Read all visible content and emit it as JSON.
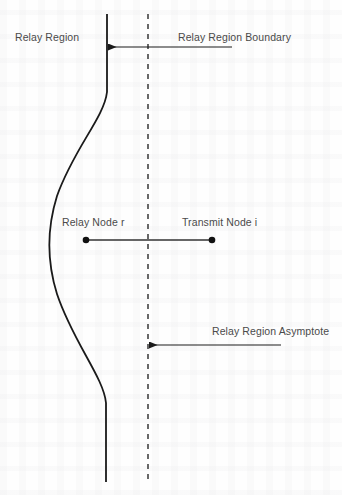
{
  "figure": {
    "width": 342,
    "height": 495,
    "background_color": "#fefefe",
    "ink_color": "#1a1a1a",
    "label_color": "#4a4a4a"
  },
  "labels": {
    "relay_region": "Relay Region",
    "relay_region_boundary": "Relay Region Boundary",
    "relay_node": "Relay Node r",
    "transmit_node": "Transmit Node i",
    "relay_region_asymptote": "Relay Region Asymptote"
  },
  "geometry": {
    "boundary_curve": {
      "name": "relay-region-boundary-curve",
      "style": "solid",
      "stroke_width": 1.8,
      "path": "M 107 14 L 107 92 C 104 118 74 148 57 196 C 47 228 47 262 57 294 C 73 342 104 378 106 403 L 106 482",
      "description": "Solid curve: vertical at top, bulging leftward through the middle, vertical at bottom"
    },
    "asymptote_line": {
      "name": "relay-region-asymptote-line",
      "style": "dashed",
      "x": 148,
      "y_start": 14,
      "y_end": 482,
      "dash": "5 5",
      "stroke_width": 1.4
    },
    "node_link": {
      "name": "node-connecting-line",
      "x_start": 86,
      "x_end": 212,
      "y": 240,
      "stroke_width": 1.3
    },
    "relay_node_point": {
      "x": 86,
      "y": 240,
      "radius": 3.3
    },
    "transmit_node_point": {
      "x": 212,
      "y": 240,
      "radius": 3.3
    },
    "boundary_arrow": {
      "name": "boundary-annotation-arrow",
      "x_tail": 232,
      "x_head": 108,
      "y": 47,
      "stroke_width": 1.2
    },
    "asymptote_arrow": {
      "name": "asymptote-annotation-arrow",
      "x_tail": 281,
      "x_head": 149,
      "y": 345,
      "stroke_width": 1.2
    }
  }
}
